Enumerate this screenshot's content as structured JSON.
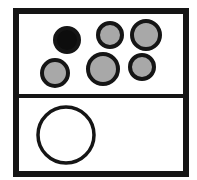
{
  "diagram": {
    "frame": {
      "x": 16,
      "y": 11,
      "width": 170,
      "height": 163,
      "stroke": "#151515",
      "stroke_width": 6
    },
    "divider": {
      "y": 96,
      "stroke_width": 4
    },
    "top_panel": {
      "circles": [
        {
          "cx": 67,
          "cy": 40,
          "r": 12,
          "fill": "#0d0d0d",
          "kind": "black-dot"
        },
        {
          "cx": 110,
          "cy": 35,
          "r": 12,
          "fill": "#a8a8a8",
          "kind": "gray-dot"
        },
        {
          "cx": 146,
          "cy": 35,
          "r": 14,
          "fill": "#a8a8a8",
          "kind": "gray-dot"
        },
        {
          "cx": 55,
          "cy": 73,
          "r": 13,
          "fill": "#a8a8a8",
          "kind": "gray-dot"
        },
        {
          "cx": 103,
          "cy": 69,
          "r": 15,
          "fill": "#a8a8a8",
          "kind": "gray-dot"
        },
        {
          "cx": 142,
          "cy": 67,
          "r": 12,
          "fill": "#a8a8a8",
          "kind": "gray-dot"
        }
      ]
    },
    "bottom_panel": {
      "circles": [
        {
          "cx": 66,
          "cy": 135,
          "r": 28,
          "fill": "#ffffff",
          "kind": "white-circle"
        }
      ]
    }
  }
}
